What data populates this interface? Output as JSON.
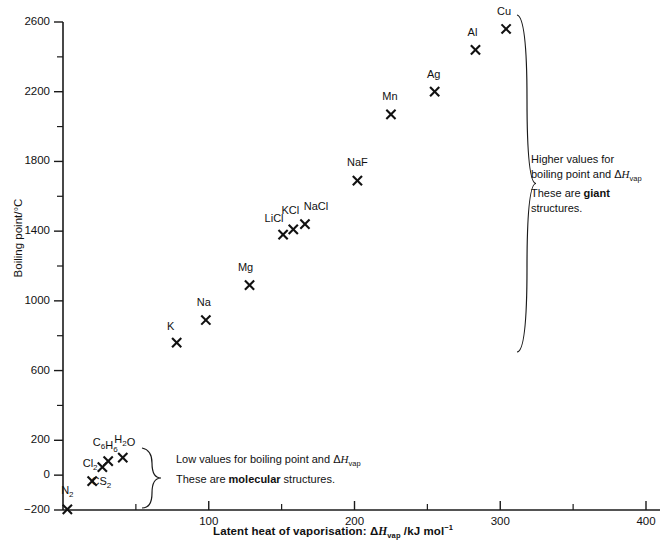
{
  "chart_data": {
    "type": "scatter",
    "title": "",
    "xlabel": "Latent heat of vaporisation: ΔHvap /kJ mol⁻¹",
    "ylabel": "Boiling point/°C",
    "xlim": [
      0,
      400
    ],
    "ylim": [
      -200,
      2600
    ],
    "x_ticks_major": [
      0,
      100,
      200,
      300,
      400
    ],
    "x_ticks_major_labels": [
      "",
      "100",
      "200",
      "300",
      "400"
    ],
    "x_ticks_minor": [
      50,
      150,
      250,
      350
    ],
    "y_ticks_major": [
      -200,
      200,
      600,
      1000,
      1400,
      1800,
      2200,
      2600
    ],
    "y_ticks_major_labels": [
      "-200",
      "200",
      "600",
      "1000",
      "1400",
      "1800",
      "2200",
      "2600"
    ],
    "y_tick_zero": 0,
    "y_tick_zero_label": "0",
    "y_ticks_minor": [
      400,
      800,
      1200,
      1600,
      2000,
      2400
    ],
    "grid": false,
    "legend": "none",
    "marker": "x",
    "points": [
      {
        "label": "N2",
        "label_text": "N",
        "sub": "2",
        "x": 3,
        "y": -196,
        "lx": 0,
        "ly": -15
      },
      {
        "label": "Cl2",
        "label_text": "Cl",
        "sub": "2",
        "x": 20,
        "y": -34,
        "lx": -2,
        "ly": -14
      },
      {
        "label": "CS2",
        "label_text": "CS",
        "sub": "2",
        "x": 27,
        "y": 46,
        "lx": -1,
        "ly": 18
      },
      {
        "label": "C6H6",
        "label_text": "C6H6",
        "sub": "",
        "x": 31,
        "y": 80,
        "lx": -3,
        "ly": -15
      },
      {
        "label": "H2O",
        "label_text": "H2O",
        "sub": "",
        "x": 41,
        "y": 100,
        "lx": 2,
        "ly": -15
      },
      {
        "label": "K",
        "label_text": "K",
        "sub": "",
        "x": 78,
        "y": 760,
        "lx": -6,
        "ly": -13
      },
      {
        "label": "Na",
        "label_text": "Na",
        "sub": "",
        "x": 98,
        "y": 890,
        "lx": -2,
        "ly": -14
      },
      {
        "label": "Mg",
        "label_text": "Mg",
        "sub": "",
        "x": 128,
        "y": 1090,
        "lx": -4,
        "ly": -14
      },
      {
        "label": "LiCl",
        "label_text": "LiCl",
        "sub": "",
        "x": 151,
        "y": 1380,
        "lx": -9,
        "ly": -13
      },
      {
        "label": "KCl",
        "label_text": "KCl",
        "sub": "",
        "x": 158,
        "y": 1410,
        "lx": -3,
        "ly": -15
      },
      {
        "label": "NaCl",
        "label_text": "NaCl",
        "sub": "",
        "x": 166,
        "y": 1440,
        "lx": 11,
        "ly": -14
      },
      {
        "label": "NaF",
        "label_text": "NaF",
        "sub": "",
        "x": 202,
        "y": 1690,
        "lx": 0,
        "ly": -15
      },
      {
        "label": "Mn",
        "label_text": "Mn",
        "sub": "",
        "x": 225,
        "y": 2070,
        "lx": -1,
        "ly": -14
      },
      {
        "label": "Ag",
        "label_text": "Ag",
        "sub": "",
        "x": 255,
        "y": 2200,
        "lx": -1,
        "ly": -14
      },
      {
        "label": "Al",
        "label_text": "Al",
        "sub": "",
        "x": 283,
        "y": 2440,
        "lx": -3,
        "ly": -14
      },
      {
        "label": "Cu",
        "label_text": "Cu",
        "sub": "",
        "x": 304,
        "y": 2560,
        "lx": -2,
        "ly": -14
      }
    ],
    "annotations": [
      {
        "id": "molecular",
        "line1": "Low values for boiling point and ΔHvap",
        "line2": "These are molecular structures.",
        "emphasis": "molecular",
        "bracket": "left-group"
      },
      {
        "id": "giant",
        "line1": "Higher values for",
        "line2": "boiling point and ΔHvap",
        "line3": "These are giant",
        "line4": "structures.",
        "emphasis": "giant",
        "bracket": "right-group"
      }
    ]
  },
  "axis": {
    "y_title_text": "Boiling point/°C",
    "x_title_prefix": "Latent heat of vaporisation: ",
    "x_title_delta": "Δ",
    "x_title_h": "H",
    "x_title_sub": "vap",
    "x_title_suffix": " /kJ mol"
  },
  "annot_molecular": {
    "l1_a": "Low values for boiling point and ",
    "l1_delta": "Δ",
    "l1_h": "H",
    "l1_sub": "vap",
    "l2_a": "These are ",
    "l2_b": "molecular",
    "l2_c": " structures."
  },
  "annot_giant": {
    "l1": "Higher values for",
    "l2_a": "boiling point and ",
    "l2_delta": "Δ",
    "l2_h": "H",
    "l2_sub": "vap",
    "l3_a": "These are ",
    "l3_b": "giant",
    "l4": "structures."
  },
  "colors": {
    "axis": "#1a1a1a",
    "marker": "#111111",
    "text": "#111111",
    "background": "#ffffff"
  }
}
